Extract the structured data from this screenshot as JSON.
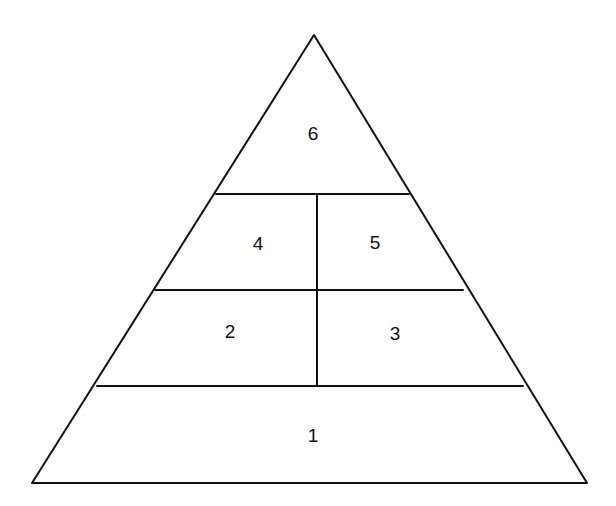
{
  "diagram": {
    "type": "pyramid",
    "outline": {
      "apex": [
        314,
        35
      ],
      "base_left": [
        32,
        483
      ],
      "base_right": [
        587,
        483
      ]
    },
    "horizontal_dividers": [
      {
        "y": 194,
        "x1": 216,
        "x2": 409
      },
      {
        "y": 290,
        "x1": 155,
        "x2": 463
      },
      {
        "y": 386,
        "x1": 97,
        "x2": 523
      }
    ],
    "vertical_divider": {
      "x": 317,
      "y1": 194,
      "y2": 386
    },
    "sections": [
      {
        "id": "1",
        "label": "1",
        "x": 313,
        "y": 435
      },
      {
        "id": "2",
        "label": "2",
        "x": 230,
        "y": 331
      },
      {
        "id": "3",
        "label": "3",
        "x": 395,
        "y": 333
      },
      {
        "id": "4",
        "label": "4",
        "x": 258,
        "y": 243
      },
      {
        "id": "5",
        "label": "5",
        "x": 375,
        "y": 242
      },
      {
        "id": "6",
        "label": "6",
        "x": 313,
        "y": 133
      }
    ],
    "stroke_color": "#111111",
    "background_color": "#ffffff"
  }
}
